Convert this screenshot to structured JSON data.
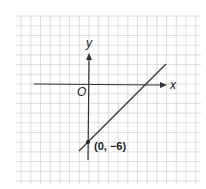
{
  "chart_data": {
    "type": "line",
    "title": "",
    "xlabel": "x",
    "ylabel": "y",
    "origin_label": "O",
    "grid": true,
    "series": [
      {
        "name": "line",
        "equation": "y = x - 6",
        "slope": 1,
        "y_intercept": -6,
        "x": [
          -1,
          8
        ],
        "y": [
          -7,
          2
        ]
      }
    ],
    "points": [
      {
        "x": 0,
        "y": -6,
        "label": "(0, −6)"
      }
    ],
    "xlim": [
      -6,
      8
    ],
    "ylim": [
      -8,
      7
    ]
  },
  "labels": {
    "x_axis": "x",
    "y_axis": "y",
    "origin": "O",
    "point": "(0, −6)"
  },
  "colors": {
    "grid": "#cfcfcf",
    "axis": "#333333",
    "line": "#333333",
    "text": "#222222"
  }
}
